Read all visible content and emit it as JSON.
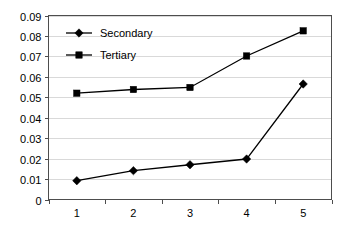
{
  "chart_data": {
    "type": "line",
    "title": "",
    "subtitle": "",
    "xlabel": "",
    "ylabel": "",
    "categories": [
      "1",
      "2",
      "3",
      "4",
      "5"
    ],
    "x": [
      1,
      2,
      3,
      4,
      5
    ],
    "series": [
      {
        "name": "Secondary",
        "marker": "diamond",
        "color": "#000000",
        "values": [
          0.0092,
          0.0141,
          0.017,
          0.0198,
          0.0565
        ]
      },
      {
        "name": "Tertiary",
        "marker": "square",
        "color": "#000000",
        "values": [
          0.052,
          0.0538,
          0.0548,
          0.0702,
          0.0825
        ]
      }
    ],
    "ylim": [
      0,
      0.09
    ],
    "ytick_values": [
      0,
      0.01,
      0.02,
      0.03,
      0.04,
      0.05,
      0.06,
      0.07,
      0.08,
      0.09
    ],
    "ytick_labels": [
      "0",
      "0.01",
      "0.02",
      "0.03",
      "0.04",
      "0.05",
      "0.06",
      "0.07",
      "0.08",
      "0.09"
    ],
    "xtick_labels": [
      "1",
      "2",
      "3",
      "4",
      "5"
    ],
    "grid": {
      "horizontal": true,
      "vertical": false,
      "color": "#d9d9d9"
    },
    "legend": {
      "position": "top-left-inside",
      "border": false,
      "entries": [
        "Secondary",
        "Tertiary"
      ]
    },
    "colors": {
      "background": "#ffffff",
      "plot_border": "#4d4d4d",
      "series": "#000000",
      "gridline": "#d9d9d9"
    }
  },
  "legend": {
    "items": [
      {
        "label": "Secondary"
      },
      {
        "label": "Tertiary"
      }
    ]
  },
  "axes": {
    "y_labels": [
      "0.09",
      "0.08",
      "0.07",
      "0.06",
      "0.05",
      "0.04",
      "0.03",
      "0.02",
      "0.01",
      "0"
    ],
    "x_labels": [
      "1",
      "2",
      "3",
      "4",
      "5"
    ]
  }
}
